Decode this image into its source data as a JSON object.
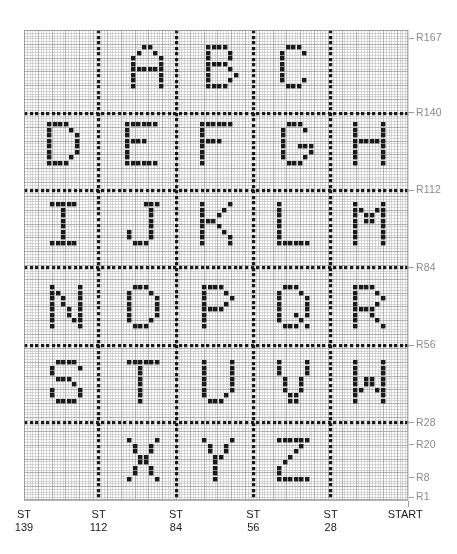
{
  "chart_data": {
    "type": "heatmap",
    "xlabel": "Stitches",
    "ylabel": "Rows",
    "grid": true,
    "legend": "none",
    "cell_px": 2.77,
    "plot_area": {
      "left": 24,
      "top": 30,
      "right": 408,
      "bottom": 500
    },
    "columns": 139,
    "rows": 170,
    "xlim": [
      1,
      139
    ],
    "ylim": [
      1,
      170
    ],
    "fill_color": "#1a1a1a",
    "grid_color": "#b9b9b9",
    "grid_major_color": "#8f8f8f",
    "row_ticks": [
      {
        "label": "R167",
        "row": 167
      },
      {
        "label": "R140",
        "row": 140
      },
      {
        "label": "R112",
        "row": 112
      },
      {
        "label": "R84",
        "row": 84
      },
      {
        "label": "R56",
        "row": 56
      },
      {
        "label": "R28",
        "row": 28
      },
      {
        "label": "R20",
        "row": 20
      },
      {
        "label": "R8",
        "row": 8
      },
      {
        "label": "R1",
        "row": 1
      }
    ],
    "stitch_ticks": [
      {
        "line1": "ST",
        "line2": "139",
        "stitch": 139
      },
      {
        "line1": "ST",
        "line2": "112",
        "stitch": 112
      },
      {
        "line1": "ST",
        "line2": "84",
        "stitch": 84
      },
      {
        "line1": "ST",
        "line2": "56",
        "stitch": 56
      },
      {
        "line1": "ST",
        "line2": "28",
        "stitch": 28
      },
      {
        "line1": "START",
        "line2": "",
        "stitch": 1
      }
    ],
    "separator_rows": [
      140,
      112,
      84,
      56,
      28
    ],
    "separator_stitches": [
      112,
      84,
      56,
      28
    ],
    "bands": [
      {
        "top_row": 167,
        "bottom_row": 140,
        "letters": [
          "A",
          "B",
          "C"
        ]
      },
      {
        "top_row": 140,
        "bottom_row": 112,
        "letters": [
          "D",
          "E",
          "F",
          "G",
          "H"
        ]
      },
      {
        "top_row": 112,
        "bottom_row": 84,
        "letters": [
          "I",
          "J",
          "K",
          "L",
          "M"
        ]
      },
      {
        "top_row": 84,
        "bottom_row": 56,
        "letters": [
          "N",
          "O",
          "P",
          "Q",
          "R"
        ]
      },
      {
        "top_row": 56,
        "bottom_row": 28,
        "letters": [
          "S",
          "T",
          "U",
          "V",
          "W"
        ]
      },
      {
        "top_row": 28,
        "bottom_row": 1,
        "letters": [
          "X",
          "Y",
          "Z"
        ]
      }
    ],
    "glyphs": {
      "A": [
        "..XX..",
        ".X..X.",
        "X....X",
        "X....X",
        "XXXXXX",
        "X....X",
        "X....X",
        "X....X"
      ],
      "B": [
        "XXXX..",
        "X...X.",
        "X...X.",
        "XXXX..",
        "X...X.",
        "X....X",
        "X...X.",
        "XXXX.."
      ],
      "C": [
        ".XXX..",
        "X...X.",
        "X.....",
        "X.....",
        "X.....",
        "X.....",
        "X...X.",
        ".XXX.."
      ],
      "D": [
        "XXXX..",
        "X...X.",
        "X....X",
        "X....X",
        "X....X",
        "X....X",
        "X...X.",
        "XXXX.."
      ],
      "E": [
        "XXXXXX",
        "X.....",
        "X.....",
        "XXXX..",
        "X.....",
        "X.....",
        "X.....",
        "XXXXXX"
      ],
      "F": [
        "XXXXXX",
        "X.....",
        "X.....",
        "XXXX..",
        "X.....",
        "X.....",
        "X.....",
        "X....."
      ],
      "G": [
        ".XXX..",
        "X...X.",
        "X.....",
        "X.....",
        "X..XXX",
        "X....X",
        "X...X.",
        ".XXX.."
      ],
      "H": [
        "X....X",
        "X....X",
        "X....X",
        "XXXXXX",
        "X....X",
        "X....X",
        "X....X",
        "X....X"
      ],
      "I": [
        "XXXXX.",
        "..X...",
        "..X...",
        "..X...",
        "..X...",
        "..X...",
        "..X...",
        "XXXXX."
      ],
      "J": [
        "...XXX",
        "....X.",
        "....X.",
        "....X.",
        "....X.",
        "X...X.",
        "X...X.",
        ".XXX.."
      ],
      "K": [
        "X....X",
        "X...X.",
        "X..X..",
        "XXX...",
        "X..X..",
        "X...X.",
        "X....X",
        "X....X"
      ],
      "L": [
        "X.....",
        "X.....",
        "X.....",
        "X.....",
        "X.....",
        "X.....",
        "X.....",
        "XXXXXX"
      ],
      "M": [
        "X....X",
        "XX..XX",
        "X.XX.X",
        "X.XX.X",
        "X....X",
        "X....X",
        "X....X",
        "X....X"
      ],
      "N": [
        "X....X",
        "XX...X",
        "X.X..X",
        "X.X..X",
        "X..X.X",
        "X..X.X",
        "X...XX",
        "X....X"
      ],
      "O": [
        ".XXX..",
        "X...X.",
        "X....X",
        "X....X",
        "X....X",
        "X....X",
        "X...X.",
        ".XXX.."
      ],
      "P": [
        "XXXX..",
        "X...X.",
        "X....X",
        "X...X.",
        "XXXX..",
        "X.....",
        "X.....",
        "X....."
      ],
      "Q": [
        ".XXX..",
        "X...X.",
        "X....X",
        "X....X",
        "X....X",
        "X..X.X",
        "X...X.",
        ".XXX.X"
      ],
      "R": [
        "XXXX..",
        "X...X.",
        "X....X",
        "X...X.",
        "XXXX..",
        "X..X..",
        "X...X.",
        "X....X"
      ],
      "S": [
        ".XXXX.",
        "X....X",
        "X.....",
        ".XXX..",
        "....X.",
        "X....X",
        "X....X",
        ".XXXX."
      ],
      "T": [
        "XXXXXX",
        "..X...",
        "..X...",
        "..X...",
        "..X...",
        "..X...",
        "..X...",
        "..X..."
      ],
      "U": [
        "X....X",
        "X....X",
        "X....X",
        "X....X",
        "X....X",
        "X....X",
        "X...X.",
        ".XXX.."
      ],
      "V": [
        "X....X",
        "X....X",
        "X....X",
        ".X..X.",
        ".X..X.",
        ".X..X.",
        "..XX..",
        "..XX.."
      ],
      "W": [
        "X....X",
        "X....X",
        "X....X",
        "X.XX.X",
        "X.XX.X",
        "XX..XX",
        "X....X",
        "X....X"
      ],
      "X": [
        "X....X",
        ".X..X.",
        ".X..X.",
        "..XX..",
        "..XX..",
        ".X..X.",
        ".X..X.",
        "X....X"
      ],
      "Y": [
        "X....X",
        ".X..X.",
        ".X..X.",
        "..XX..",
        "..X...",
        "..X...",
        "..X...",
        "..X..."
      ],
      "Z": [
        "XXXXXX",
        "....X.",
        "...X..",
        "..X...",
        ".X....",
        "X.....",
        "X.....",
        "XXXXXX"
      ]
    },
    "letter_positions": [
      {
        "letter": "A",
        "cell_x": 131,
        "cell_y": 45
      },
      {
        "letter": "B",
        "cell_x": 206,
        "cell_y": 45
      },
      {
        "letter": "C",
        "cell_x": 280,
        "cell_y": 45
      },
      {
        "letter": "D",
        "cell_x": 47,
        "cell_y": 122
      },
      {
        "letter": "E",
        "cell_x": 125,
        "cell_y": 122
      },
      {
        "letter": "F",
        "cell_x": 200,
        "cell_y": 122
      },
      {
        "letter": "G",
        "cell_x": 281,
        "cell_y": 122
      },
      {
        "letter": "H",
        "cell_x": 353,
        "cell_y": 122
      },
      {
        "letter": "I",
        "cell_x": 50,
        "cell_y": 202
      },
      {
        "letter": "J",
        "cell_x": 127,
        "cell_y": 202
      },
      {
        "letter": "K",
        "cell_x": 200,
        "cell_y": 202
      },
      {
        "letter": "L",
        "cell_x": 277,
        "cell_y": 202
      },
      {
        "letter": "M",
        "cell_x": 353,
        "cell_y": 202
      },
      {
        "letter": "N",
        "cell_x": 50,
        "cell_y": 285
      },
      {
        "letter": "O",
        "cell_x": 127,
        "cell_y": 285
      },
      {
        "letter": "P",
        "cell_x": 202,
        "cell_y": 285
      },
      {
        "letter": "Q",
        "cell_x": 277,
        "cell_y": 285
      },
      {
        "letter": "R",
        "cell_x": 353,
        "cell_y": 285
      },
      {
        "letter": "S",
        "cell_x": 50,
        "cell_y": 360
      },
      {
        "letter": "T",
        "cell_x": 127,
        "cell_y": 360
      },
      {
        "letter": "U",
        "cell_x": 202,
        "cell_y": 360
      },
      {
        "letter": "V",
        "cell_x": 277,
        "cell_y": 360
      },
      {
        "letter": "W",
        "cell_x": 353,
        "cell_y": 360
      },
      {
        "letter": "X",
        "cell_x": 127,
        "cell_y": 438
      },
      {
        "letter": "Y",
        "cell_x": 202,
        "cell_y": 438
      },
      {
        "letter": "Z",
        "cell_x": 277,
        "cell_y": 438
      }
    ]
  }
}
